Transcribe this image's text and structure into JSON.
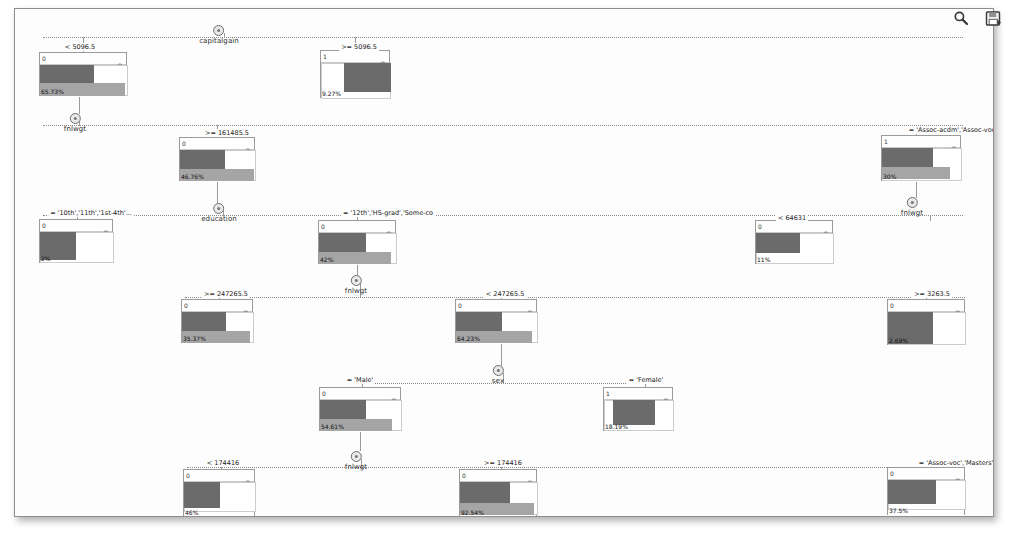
{
  "app": {
    "title": "Decision Tree Viewer",
    "background": "#ffffff",
    "frame_border": "#8e8e8e"
  },
  "toolbar": {
    "items": [
      {
        "name": "zoom-icon",
        "label": "Zoom"
      },
      {
        "name": "save-icon",
        "label": "Save"
      }
    ]
  },
  "colors": {
    "bar_dark": "#6b6b6b",
    "bar_mid": "#a5a5a5",
    "bar_light": "#ffffff",
    "edge": "#8a8a8a",
    "text": "#222222"
  },
  "tree": {
    "splits": [
      {
        "id": "s-capitalgain",
        "variable": "capitalgain",
        "x": 204,
        "y": 16
      },
      {
        "id": "s-fnlwgt-1",
        "variable": "fnlwgt",
        "x": 60,
        "y": 104
      },
      {
        "id": "s-education",
        "variable": "education",
        "x": 204,
        "y": 194
      },
      {
        "id": "s-fnlwgt-2",
        "variable": "fnlwgt",
        "x": 341,
        "y": 266
      },
      {
        "id": "s-sex",
        "variable": "sex",
        "x": 483,
        "y": 356
      },
      {
        "id": "s-fnlwgt-3",
        "variable": "fnlwgt",
        "x": 341,
        "y": 442
      },
      {
        "id": "s-fnlwgt-4",
        "variable": "fnlwgt",
        "x": 897,
        "y": 188
      }
    ],
    "conditions": [
      {
        "id": "c-cg-lt",
        "text": "< 5096.5",
        "x": 65,
        "y": 34
      },
      {
        "id": "c-cg-ge",
        "text": ">= 5096.5",
        "x": 344,
        "y": 34
      },
      {
        "id": "c-fw1-ge",
        "text": ">= 161485.5",
        "x": 212,
        "y": 120
      },
      {
        "id": "c-ed-l",
        "text": "= '10th','11th','1st-4th'...",
        "x": 76,
        "y": 200
      },
      {
        "id": "c-ed-r",
        "text": "= '12th','HS-grad','Some-co",
        "x": 373,
        "y": 200
      },
      {
        "id": "c-as-acdm",
        "text": "= 'Assoc-acdm','Assoc-voc'...",
        "x": 941,
        "y": 117
      },
      {
        "id": "c-fw2-ge",
        "text": ">= 247265.5",
        "x": 211,
        "y": 281
      },
      {
        "id": "c-fw2-lt",
        "text": "< 247265.5",
        "x": 490,
        "y": 281
      },
      {
        "id": "c-fw4-lt",
        "text": "< 64631",
        "x": 777,
        "y": 205
      },
      {
        "id": "c-fw4-ge",
        "text": ">= 3263.5",
        "x": 917,
        "y": 281
      },
      {
        "id": "c-sex-m",
        "text": "= 'Male'",
        "x": 345,
        "y": 367
      },
      {
        "id": "c-sex-f",
        "text": "= 'Female'",
        "x": 631,
        "y": 367
      },
      {
        "id": "c-fw3-lt",
        "text": "< 174416",
        "x": 208,
        "y": 450
      },
      {
        "id": "c-fw3-ge",
        "text": ">= 174416",
        "x": 488,
        "y": 450
      },
      {
        "id": "c-as-voc",
        "text": "= 'Assoc-voc','Masters'",
        "x": 941,
        "y": 450
      }
    ],
    "nodes": [
      {
        "id": "n1",
        "node_id": "0",
        "pct": "65.73%",
        "x": 24,
        "y": 43,
        "w": 88,
        "h": 44,
        "bars": [
          {
            "class": "dark",
            "top": 0,
            "height": 18,
            "width": 54
          },
          {
            "class": "mid",
            "top": 18,
            "height": 13,
            "width": 85
          },
          {
            "class": "light",
            "top": 0,
            "height": 31,
            "width": 88
          }
        ]
      },
      {
        "id": "n2",
        "node_id": "1",
        "pct": "9.27%",
        "x": 305,
        "y": 41,
        "w": 70,
        "h": 48,
        "bars": [
          {
            "class": "light",
            "top": 0,
            "height": 36,
            "width": 70
          },
          {
            "class": "dark",
            "top": 0,
            "height": 29,
            "width": 47,
            "left": 23
          }
        ]
      },
      {
        "id": "n3",
        "node_id": "0",
        "pct": "46.76%",
        "x": 164,
        "y": 128,
        "w": 76,
        "h": 44,
        "bars": [
          {
            "class": "dark",
            "top": 0,
            "height": 19,
            "width": 45
          },
          {
            "class": "mid",
            "top": 19,
            "height": 12,
            "width": 74
          },
          {
            "class": "light",
            "top": 0,
            "height": 31,
            "width": 76
          }
        ]
      },
      {
        "id": "n4",
        "node_id": "1",
        "pct": "30%",
        "x": 866,
        "y": 126,
        "w": 80,
        "h": 46,
        "bars": [
          {
            "class": "dark",
            "top": 0,
            "height": 19,
            "width": 51
          },
          {
            "class": "mid",
            "top": 19,
            "height": 12,
            "width": 68
          },
          {
            "class": "light",
            "top": 0,
            "height": 33,
            "width": 80
          }
        ]
      },
      {
        "id": "n5",
        "node_id": "0",
        "pct": "2%",
        "x": 24,
        "y": 210,
        "w": 74,
        "h": 44,
        "bars": [
          {
            "class": "dark",
            "top": 0,
            "height": 28,
            "width": 36
          },
          {
            "class": "light",
            "top": 0,
            "height": 31,
            "width": 74
          }
        ]
      },
      {
        "id": "n6",
        "node_id": "0",
        "pct": "42%",
        "x": 303,
        "y": 211,
        "w": 78,
        "h": 44,
        "bars": [
          {
            "class": "dark",
            "top": 0,
            "height": 19,
            "width": 47
          },
          {
            "class": "mid",
            "top": 19,
            "height": 12,
            "width": 72
          },
          {
            "class": "light",
            "top": 0,
            "height": 31,
            "width": 78
          }
        ]
      },
      {
        "id": "n7",
        "node_id": "0",
        "pct": "11%",
        "x": 740,
        "y": 211,
        "w": 78,
        "h": 44,
        "bars": [
          {
            "class": "dark",
            "top": 0,
            "height": 20,
            "width": 44
          },
          {
            "class": "light",
            "top": 0,
            "height": 31,
            "width": 78
          }
        ]
      },
      {
        "id": "n8",
        "node_id": "0",
        "pct": "35.37%",
        "x": 166,
        "y": 290,
        "w": 72,
        "h": 44,
        "bars": [
          {
            "class": "dark",
            "top": 0,
            "height": 19,
            "width": 44
          },
          {
            "class": "mid",
            "top": 19,
            "height": 12,
            "width": 68
          },
          {
            "class": "light",
            "top": 0,
            "height": 31,
            "width": 72
          }
        ]
      },
      {
        "id": "n9",
        "node_id": "0",
        "pct": "64.23%",
        "x": 440,
        "y": 290,
        "w": 82,
        "h": 44,
        "bars": [
          {
            "class": "dark",
            "top": 0,
            "height": 19,
            "width": 46
          },
          {
            "class": "mid",
            "top": 19,
            "height": 12,
            "width": 76
          },
          {
            "class": "light",
            "top": 0,
            "height": 31,
            "width": 82
          }
        ]
      },
      {
        "id": "n10",
        "node_id": "0",
        "pct": "2.69%",
        "x": 872,
        "y": 290,
        "w": 78,
        "h": 46,
        "bars": [
          {
            "class": "dark",
            "top": 0,
            "height": 32,
            "width": 45
          },
          {
            "class": "light",
            "top": 0,
            "height": 33,
            "width": 78
          }
        ]
      },
      {
        "id": "n11",
        "node_id": "0",
        "pct": "54.61%",
        "x": 304,
        "y": 378,
        "w": 82,
        "h": 44,
        "bars": [
          {
            "class": "dark",
            "top": 0,
            "height": 19,
            "width": 46
          },
          {
            "class": "mid",
            "top": 19,
            "height": 12,
            "width": 72
          },
          {
            "class": "light",
            "top": 0,
            "height": 31,
            "width": 82
          }
        ]
      },
      {
        "id": "n12",
        "node_id": "1",
        "pct": "18.19%",
        "x": 588,
        "y": 378,
        "w": 70,
        "h": 44,
        "bars": [
          {
            "class": "light",
            "top": 0,
            "height": 31,
            "width": 70
          },
          {
            "class": "dark",
            "top": 0,
            "height": 25,
            "width": 42,
            "left": 9
          }
        ]
      },
      {
        "id": "n13",
        "node_id": "0",
        "pct": "46%",
        "x": 168,
        "y": 460,
        "w": 72,
        "h": 48,
        "bars": [
          {
            "class": "dark",
            "top": 0,
            "height": 26,
            "width": 36
          },
          {
            "class": "light",
            "top": 0,
            "height": 30,
            "width": 72
          }
        ]
      },
      {
        "id": "n14",
        "node_id": "0",
        "pct": "92.54%",
        "x": 444,
        "y": 460,
        "w": 78,
        "h": 48,
        "bars": [
          {
            "class": "dark",
            "top": 0,
            "height": 21,
            "width": 50
          },
          {
            "class": "mid",
            "top": 21,
            "height": 12,
            "width": 74
          },
          {
            "class": "light",
            "top": 0,
            "height": 33,
            "width": 78
          }
        ]
      },
      {
        "id": "n15",
        "node_id": "0",
        "pct": "37.5%",
        "x": 872,
        "y": 458,
        "w": 78,
        "h": 48,
        "bars": [
          {
            "class": "dark",
            "top": 0,
            "height": 24,
            "width": 48
          },
          {
            "class": "light",
            "top": 0,
            "height": 30,
            "width": 78
          }
        ]
      }
    ],
    "edges": [
      {
        "type": "h",
        "x": 28,
        "y": 28,
        "w": 920
      },
      {
        "type": "v",
        "x": 209,
        "y": 24,
        "h": 5
      },
      {
        "type": "v",
        "x": 68,
        "y": 28,
        "h": 16
      },
      {
        "type": "v",
        "x": 340,
        "y": 28,
        "h": 14
      },
      {
        "type": "v",
        "x": 64,
        "y": 87,
        "h": 18
      },
      {
        "type": "h",
        "x": 28,
        "y": 116,
        "w": 920
      },
      {
        "type": "v",
        "x": 64,
        "y": 112,
        "h": 5
      },
      {
        "type": "v",
        "x": 202,
        "y": 116,
        "h": 13
      },
      {
        "type": "v",
        "x": 901,
        "y": 116,
        "h": 11
      },
      {
        "type": "v",
        "x": 202,
        "y": 172,
        "h": 22
      },
      {
        "type": "h",
        "x": 28,
        "y": 206,
        "w": 920
      },
      {
        "type": "v",
        "x": 208,
        "y": 202,
        "h": 5
      },
      {
        "type": "v",
        "x": 62,
        "y": 206,
        "h": 5
      },
      {
        "type": "v",
        "x": 342,
        "y": 206,
        "h": 6
      },
      {
        "type": "v",
        "x": 901,
        "y": 172,
        "h": 17
      },
      {
        "type": "v",
        "x": 778,
        "y": 206,
        "h": 6
      },
      {
        "type": "v",
        "x": 915,
        "y": 206,
        "h": 6
      },
      {
        "type": "v",
        "x": 342,
        "y": 255,
        "h": 13
      },
      {
        "type": "h",
        "x": 170,
        "y": 288,
        "w": 780
      },
      {
        "type": "v",
        "x": 345,
        "y": 274,
        "h": 14
      },
      {
        "type": "v",
        "x": 204,
        "y": 288,
        "h": 3
      },
      {
        "type": "v",
        "x": 486,
        "y": 288,
        "h": 3
      },
      {
        "type": "v",
        "x": 911,
        "y": 288,
        "h": 3
      },
      {
        "type": "v",
        "x": 486,
        "y": 334,
        "h": 23
      },
      {
        "type": "h",
        "x": 345,
        "y": 374,
        "w": 290
      },
      {
        "type": "v",
        "x": 488,
        "y": 364,
        "h": 11
      },
      {
        "type": "v",
        "x": 347,
        "y": 374,
        "h": 5
      },
      {
        "type": "v",
        "x": 630,
        "y": 374,
        "h": 5
      },
      {
        "type": "v",
        "x": 345,
        "y": 422,
        "h": 20
      },
      {
        "type": "h",
        "x": 172,
        "y": 458,
        "w": 776
      },
      {
        "type": "v",
        "x": 346,
        "y": 450,
        "h": 9
      },
      {
        "type": "v",
        "x": 206,
        "y": 458,
        "h": 3
      },
      {
        "type": "v",
        "x": 486,
        "y": 458,
        "h": 3
      },
      {
        "type": "v",
        "x": 911,
        "y": 458,
        "h": 1
      },
      {
        "type": "v",
        "x": 486,
        "y": 508,
        "h": 14
      }
    ]
  }
}
